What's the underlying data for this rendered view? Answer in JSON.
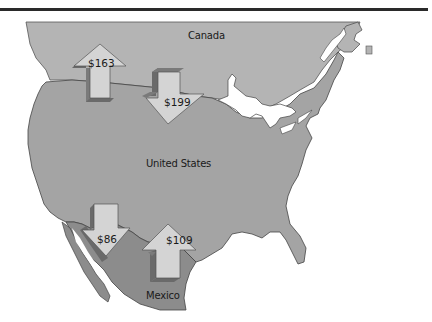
{
  "map": {
    "regions": [
      {
        "name": "Canada",
        "color": "#b4b4b4"
      },
      {
        "name": "United States",
        "color": "#a4a4a4"
      },
      {
        "name": "Mexico",
        "color": "#8c8c8c"
      }
    ],
    "flows": [
      {
        "id": "us-to-canada",
        "value": "$163",
        "direction": "up",
        "from": "United States",
        "to": "Canada"
      },
      {
        "id": "canada-to-us",
        "value": "$199",
        "direction": "down",
        "from": "Canada",
        "to": "United States"
      },
      {
        "id": "us-to-mexico",
        "value": "$86",
        "direction": "down",
        "from": "United States",
        "to": "Mexico"
      },
      {
        "id": "mexico-to-us",
        "value": "$109",
        "direction": "up",
        "from": "Mexico",
        "to": "United States"
      }
    ],
    "colors": {
      "arrow_face": "#d4d4d4",
      "arrow_side": "#7a7a7a",
      "border": "#333333",
      "water": "#ffffff"
    }
  }
}
